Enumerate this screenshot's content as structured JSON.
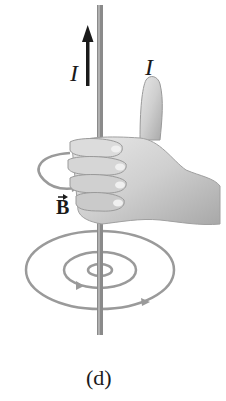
{
  "figure": {
    "caption": "(d)",
    "labels": {
      "current_arrow": "I",
      "current_thumb": "I",
      "magnetic_field": "B"
    },
    "colors": {
      "wire": "#8a8a8a",
      "field_lines": "#9a9a9a",
      "skin": "#c8c8c8",
      "text": "#1a1a1a"
    }
  }
}
